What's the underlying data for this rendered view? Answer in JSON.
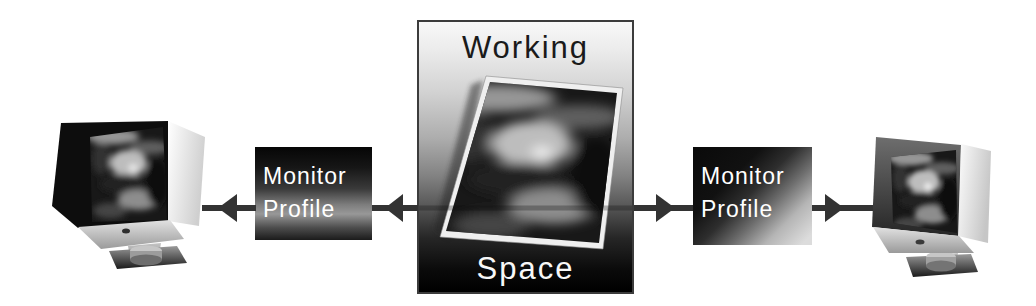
{
  "diagram": {
    "background_color": "#ffffff",
    "working_space_box": {
      "label_top": "Working",
      "label_bottom": "Space",
      "top_text_color": "#1a1a1a",
      "bottom_text_color": "#f8f8f8",
      "gradient_top": "#f8f8f8",
      "gradient_bottom": "#000000"
    },
    "monitor_profile_left_box": {
      "line1": "Monitor",
      "line2": "Profile",
      "text_color": "#ffffff"
    },
    "monitor_profile_right_box": {
      "line1": "Monitor",
      "line2": "Profile",
      "text_color": "#ffffff"
    },
    "arrow_color": "#333333",
    "illustrations": {
      "left_monitor": "crt-monitor-displaying-photo",
      "right_monitor": "crt-monitor-displaying-photo",
      "center_photo": "tilted-blurred-portrait-photo"
    },
    "connectors": [
      {
        "between": [
          "working-space",
          "monitor-profile-left"
        ],
        "direction": "left"
      },
      {
        "between": [
          "monitor-profile-left",
          "left-monitor"
        ],
        "direction": "left"
      },
      {
        "between": [
          "working-space",
          "monitor-profile-right"
        ],
        "direction": "right"
      },
      {
        "between": [
          "monitor-profile-right",
          "right-monitor"
        ],
        "direction": "right"
      }
    ]
  }
}
